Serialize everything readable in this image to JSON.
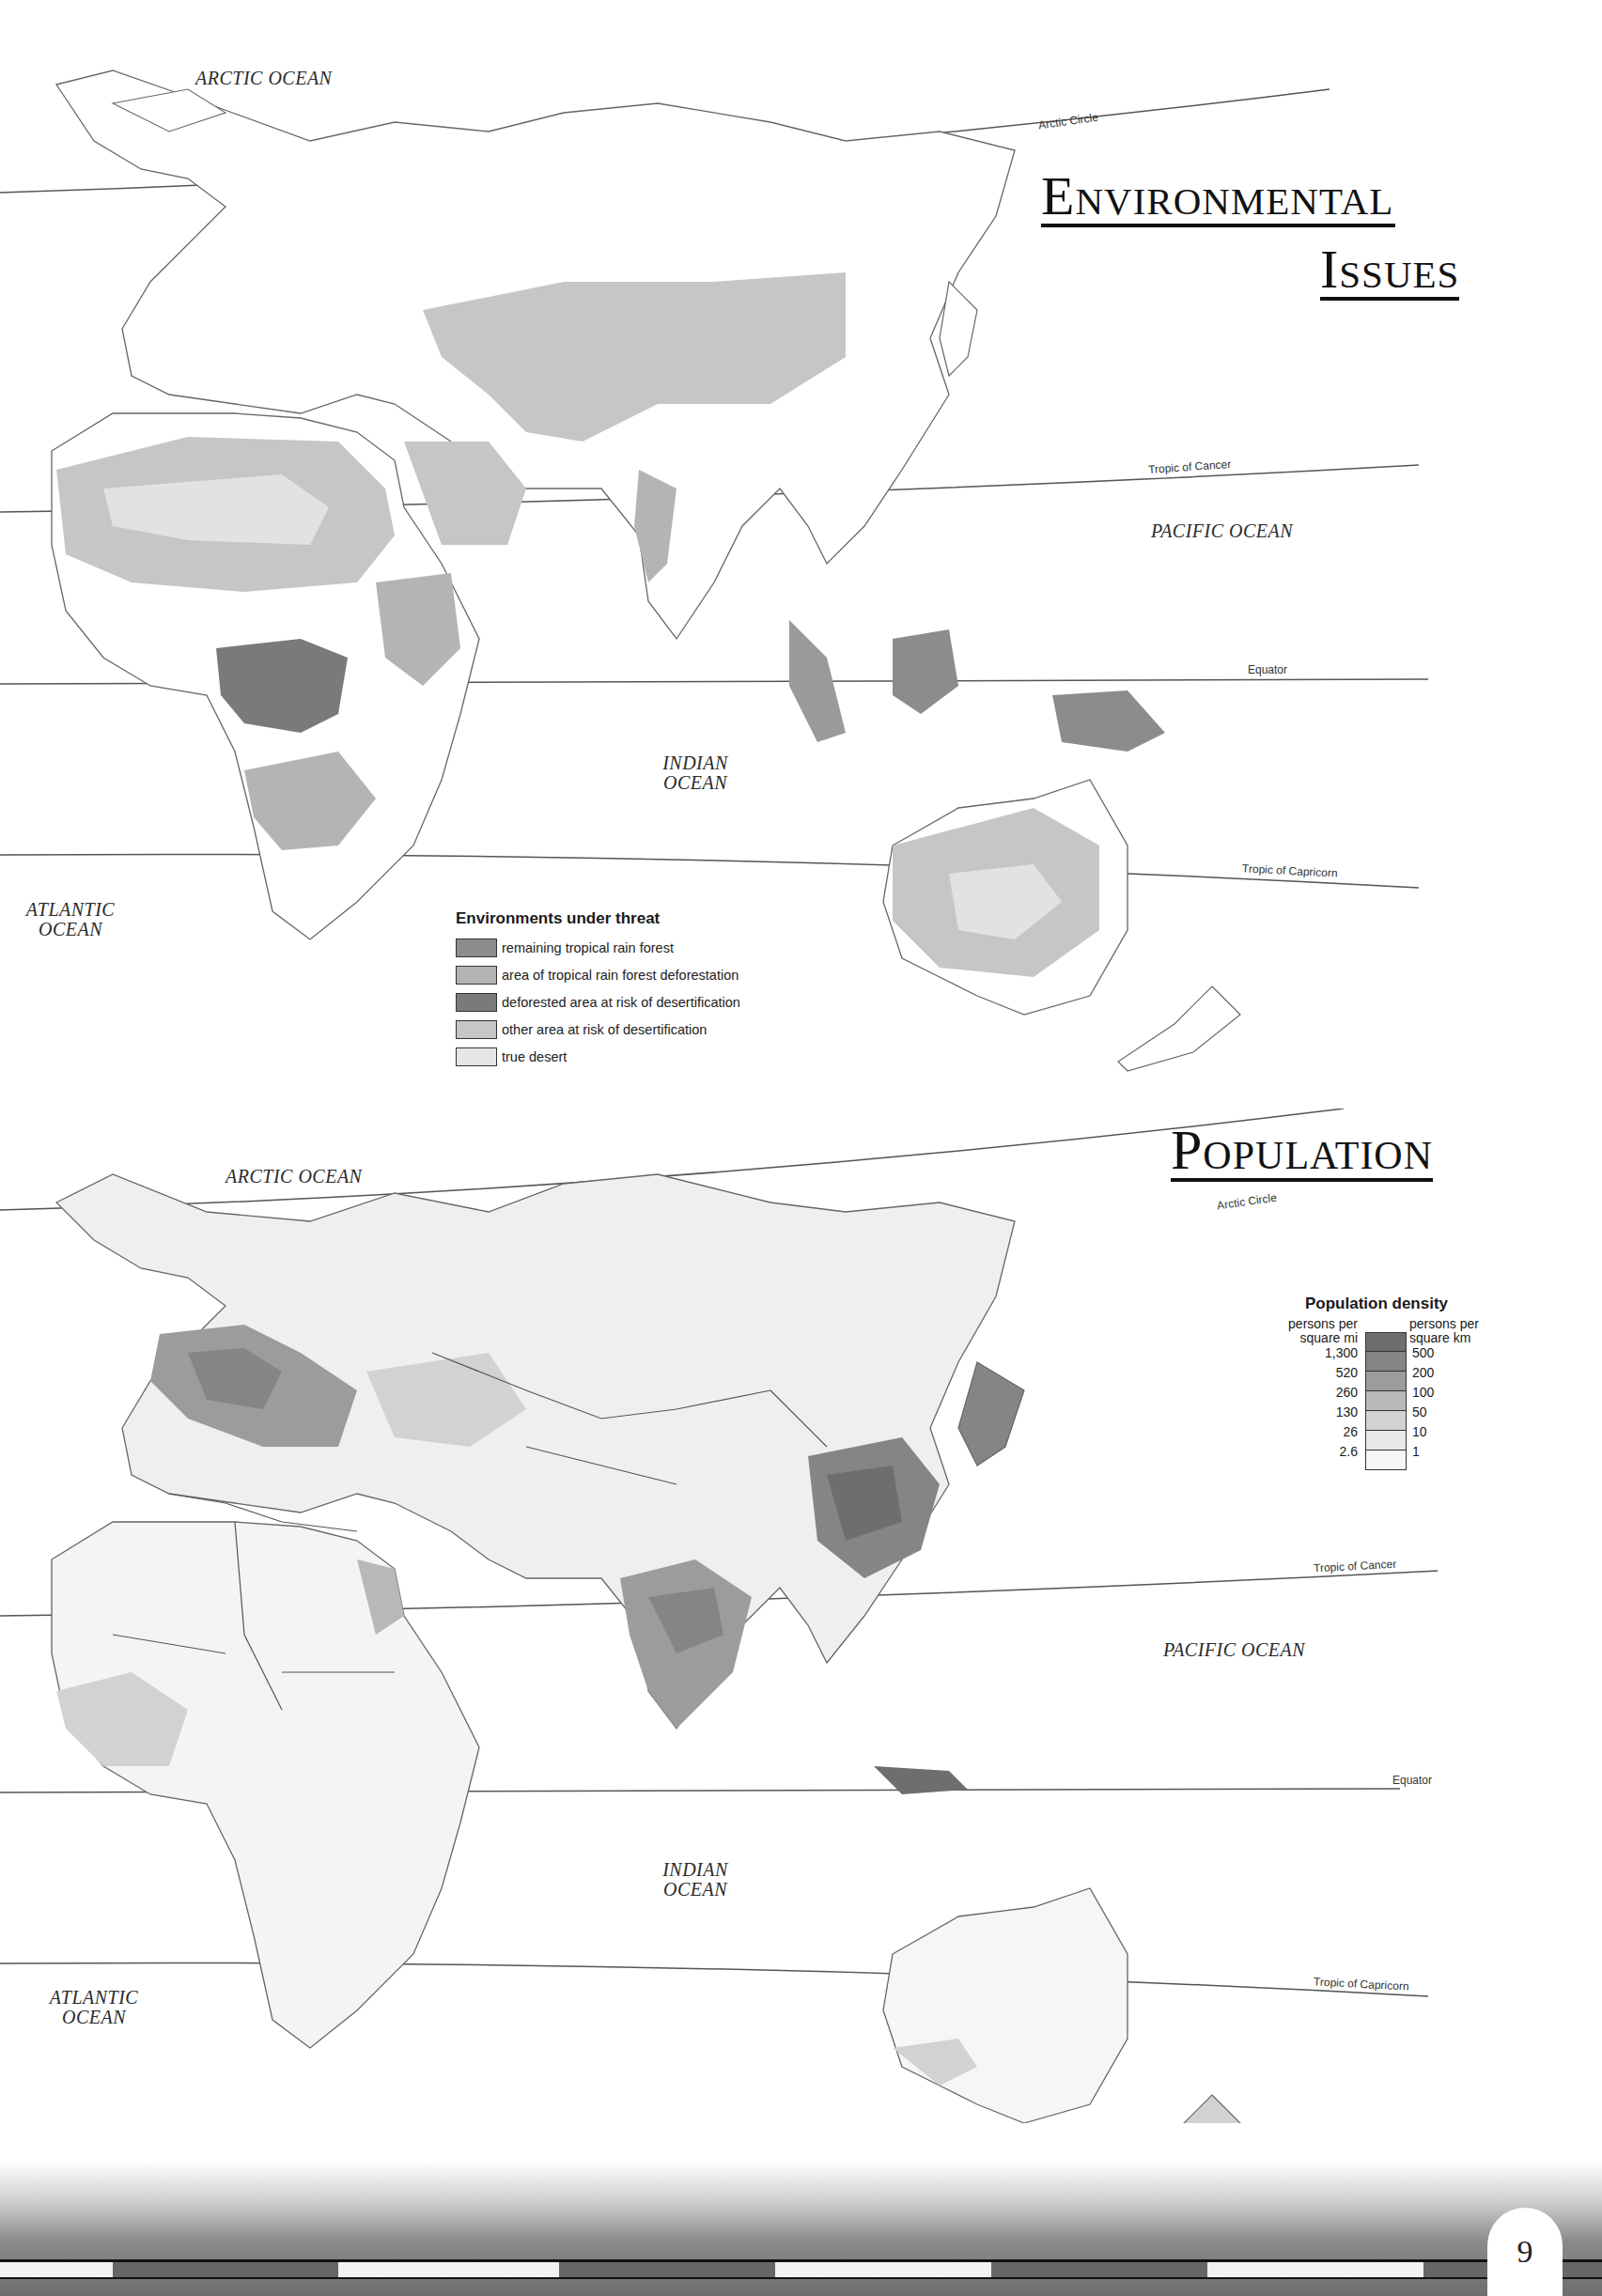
{
  "page": {
    "page_number": "9"
  },
  "environmental_map": {
    "title_line1": "Environmental",
    "title_line2": "Issues",
    "oceans": {
      "arctic": "ARCTIC OCEAN",
      "pacific": "PACIFIC OCEAN",
      "indian_line1": "INDIAN",
      "indian_line2": "OCEAN",
      "atlantic_line1": "ATLANTIC",
      "atlantic_line2": "OCEAN"
    },
    "latitude_lines": {
      "arctic_circle": "Arctic Circle",
      "tropic_of_cancer": "Tropic of Cancer",
      "equator": "Equator",
      "tropic_of_capricorn": "Tropic of Capricorn"
    },
    "legend": {
      "title": "Environments under threat",
      "items": [
        {
          "label": "remaining tropical rain forest",
          "color": "#8c8c8c"
        },
        {
          "label": "area of tropical rain forest deforestation",
          "color": "#b4b4b4"
        },
        {
          "label": "deforested area at risk of desertification",
          "color": "#7a7a7a"
        },
        {
          "label": "other area at risk of desertification",
          "color": "#c6c6c6"
        },
        {
          "label": "true desert",
          "color": "#e6e6e6"
        }
      ]
    }
  },
  "population_map": {
    "title": "Population",
    "oceans": {
      "arctic": "ARCTIC OCEAN",
      "pacific": "PACIFIC OCEAN",
      "indian_line1": "INDIAN",
      "indian_line2": "OCEAN",
      "atlantic_line1": "ATLANTIC",
      "atlantic_line2": "OCEAN"
    },
    "latitude_lines": {
      "arctic_circle": "Arctic Circle",
      "tropic_of_cancer": "Tropic of Cancer",
      "equator": "Equator",
      "tropic_of_capricorn": "Tropic of Capricorn"
    },
    "legend": {
      "title": "Population density",
      "left_unit_line1": "persons per",
      "left_unit_line2": "square mi",
      "right_unit_line1": "persons per",
      "right_unit_line2": "square km",
      "breaks": [
        {
          "per_sq_mi": "1,300",
          "per_sq_km": "500"
        },
        {
          "per_sq_mi": "520",
          "per_sq_km": "200"
        },
        {
          "per_sq_mi": "260",
          "per_sq_km": "100"
        },
        {
          "per_sq_mi": "130",
          "per_sq_km": "50"
        },
        {
          "per_sq_mi": "26",
          "per_sq_km": "10"
        },
        {
          "per_sq_mi": "2.6",
          "per_sq_km": "1"
        }
      ],
      "colors": [
        "#6e6e6e",
        "#858585",
        "#9c9c9c",
        "#b8b8b8",
        "#d2d2d2",
        "#e8e8e8",
        "#f6f6f6"
      ]
    }
  }
}
